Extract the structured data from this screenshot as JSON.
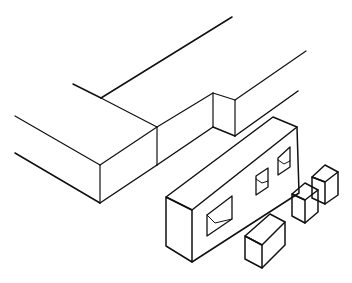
{
  "diagram": {
    "stroke_color": "#111111",
    "background": "#ffffff",
    "parts": [
      {
        "name": "beam-with-notch"
      },
      {
        "name": "slotted-tenon-block"
      },
      {
        "name": "small-cube-1"
      },
      {
        "name": "small-cube-2"
      },
      {
        "name": "small-cube-3"
      }
    ]
  }
}
